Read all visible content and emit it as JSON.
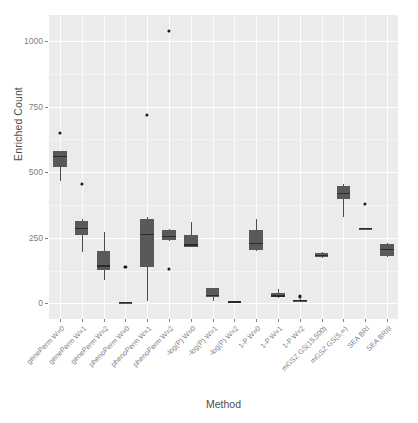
{
  "chart_data": {
    "type": "box",
    "title": "",
    "xlabel": "Method",
    "ylabel": "Enriched Count",
    "ylim": [
      -60,
      1100
    ],
    "yticks": [
      0,
      250,
      500,
      750,
      1000
    ],
    "ytick_labels": [
      "0",
      "250",
      "500",
      "750",
      "1000"
    ],
    "grid": true,
    "legend": "none",
    "categories": [
      "genePerm W=0",
      "genePerm W=1",
      "genePerm W=2",
      "phenoPerm W=0",
      "phenoPerm W=1",
      "phenoPerm W=2",
      "-log(P) W=0",
      "-log(P) W=1",
      "-log(P) W=2",
      "1-P W=0",
      "1-P W=1",
      "1-P W=2",
      "mGSZ GS(15,500)",
      "mGSZ GS(5,∞)",
      "SEA BRI",
      "SEA BRIII"
    ],
    "boxes": [
      {
        "category": "genePerm W=0",
        "lower_whisker": 468,
        "q1": 520,
        "median": 560,
        "q3": 580,
        "upper_whisker": 580,
        "outliers": [
          650
        ]
      },
      {
        "category": "genePerm W=1",
        "lower_whisker": 196,
        "q1": 262,
        "median": 285,
        "q3": 315,
        "upper_whisker": 322,
        "outliers": [
          455
        ]
      },
      {
        "category": "genePerm W=2",
        "lower_whisker": 88,
        "q1": 128,
        "median": 142,
        "q3": 200,
        "upper_whisker": 272,
        "outliers": []
      },
      {
        "category": "phenoPerm W=0",
        "lower_whisker": 0,
        "q1": 0,
        "median": 2,
        "q3": 4,
        "upper_whisker": 6,
        "outliers": [
          140
        ]
      },
      {
        "category": "phenoPerm W=1",
        "lower_whisker": 8,
        "q1": 140,
        "median": 262,
        "q3": 322,
        "upper_whisker": 330,
        "outliers": [
          720
        ]
      },
      {
        "category": "phenoPerm W=2",
        "lower_whisker": 238,
        "q1": 240,
        "median": 255,
        "q3": 280,
        "upper_whisker": 284,
        "outliers": [
          1040,
          130
        ]
      },
      {
        "category": "-log(P) W=0",
        "lower_whisker": 214,
        "q1": 216,
        "median": 222,
        "q3": 262,
        "upper_whisker": 312,
        "outliers": []
      },
      {
        "category": "-log(P) W=1",
        "lower_whisker": 10,
        "q1": 22,
        "median": 30,
        "q3": 58,
        "upper_whisker": 60,
        "outliers": []
      },
      {
        "category": "-log(P) W=2",
        "lower_whisker": 2,
        "q1": 3,
        "median": 5,
        "q3": 8,
        "upper_whisker": 10,
        "outliers": []
      },
      {
        "category": "1-P W=0",
        "lower_whisker": 200,
        "q1": 205,
        "median": 228,
        "q3": 280,
        "upper_whisker": 322,
        "outliers": []
      },
      {
        "category": "1-P W=1",
        "lower_whisker": 20,
        "q1": 24,
        "median": 28,
        "q3": 38,
        "upper_whisker": 56,
        "outliers": []
      },
      {
        "category": "1-P W=2",
        "lower_whisker": 6,
        "q1": 8,
        "median": 10,
        "q3": 14,
        "upper_whisker": 16,
        "outliers": [
          26
        ]
      },
      {
        "category": "mGSZ GS(15,500)",
        "lower_whisker": 172,
        "q1": 176,
        "median": 182,
        "q3": 192,
        "upper_whisker": 196,
        "outliers": []
      },
      {
        "category": "mGSZ GS(5,∞)",
        "lower_whisker": 330,
        "q1": 398,
        "median": 420,
        "q3": 448,
        "upper_whisker": 456,
        "outliers": []
      },
      {
        "category": "SEA BRI",
        "lower_whisker": 284,
        "q1": 284,
        "median": 286,
        "q3": 288,
        "upper_whisker": 288,
        "outliers": [
          378
        ]
      },
      {
        "category": "SEA BRIII",
        "lower_whisker": 176,
        "q1": 182,
        "median": 206,
        "q3": 228,
        "upper_whisker": 230,
        "outliers": []
      }
    ],
    "colors": {
      "panel_background": "#ebebeb",
      "gridline_major": "#ffffff",
      "gridline_minor": "#f5f5f5",
      "box_fill": "#595959",
      "box_line": "#4d4d4d",
      "median_line": "#2b2b2b",
      "outlier": "#1a1a1a",
      "axis_text": "#808080",
      "axis_title": "#4d4d4d"
    }
  }
}
